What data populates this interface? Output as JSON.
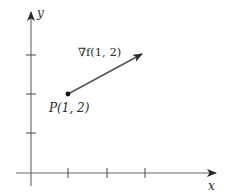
{
  "diagram": {
    "type": "gradient-vector",
    "axes": {
      "x_label": "x",
      "y_label": "y",
      "x_ticks": [
        1,
        2,
        3
      ],
      "y_ticks": [
        1,
        2,
        3
      ]
    },
    "point": {
      "label": "P(1, 2)",
      "x": 1,
      "y": 2
    },
    "vector": {
      "label": "∇f(1, 2)",
      "from": [
        1,
        2
      ],
      "to": [
        3,
        3.05
      ]
    },
    "colors": {
      "axis": "#555555",
      "vector": "#555555",
      "point": "#111111",
      "text": "#2a2a2a"
    }
  }
}
